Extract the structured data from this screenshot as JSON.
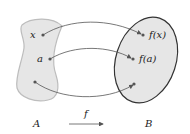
{
  "diagram": {
    "set_domain_label": "A",
    "set_codomain_label": "B",
    "function_label": "f",
    "domain_points": [
      {
        "label": "x"
      },
      {
        "label": "a"
      },
      {
        "label": ""
      }
    ],
    "codomain_points": [
      {
        "label": "f(x)"
      },
      {
        "label": "f(a)"
      },
      {
        "label": ""
      }
    ],
    "colors": {
      "set_fill": "#e6e6e6",
      "domain_stroke": "#bdbdbd",
      "codomain_stroke": "#333333",
      "arrow": "#555555",
      "point": "#555555"
    }
  }
}
